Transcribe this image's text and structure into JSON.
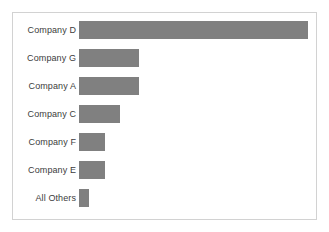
{
  "chart_data": {
    "type": "bar",
    "orientation": "horizontal",
    "title": "",
    "subtitle": "",
    "xlabel": "",
    "ylabel": "",
    "grid": false,
    "legend": false,
    "axis_visible": false,
    "tick_labels_x": [],
    "categories": [
      "Company D",
      "Company G",
      "Company A",
      "Company C",
      "Company F",
      "Company E",
      "All Others"
    ],
    "values": [
      100.0,
      26.4,
      26.0,
      17.7,
      11.3,
      11.3,
      4.3
    ],
    "xlim": [
      0,
      100
    ],
    "bars": [
      {
        "label": "Company D",
        "value": 100.0
      },
      {
        "label": "Company G",
        "value": 26.4
      },
      {
        "label": "Company A",
        "value": 26.0
      },
      {
        "label": "Company C",
        "value": 17.7
      },
      {
        "label": "Company F",
        "value": 11.3
      },
      {
        "label": "Company E",
        "value": 11.3
      },
      {
        "label": "All Others",
        "value": 4.3
      }
    ]
  },
  "style": {
    "bar_color": "#808080",
    "frame_border_color": "#d2d2d2",
    "label_color": "#3c3c3c",
    "background": "#ffffff"
  }
}
